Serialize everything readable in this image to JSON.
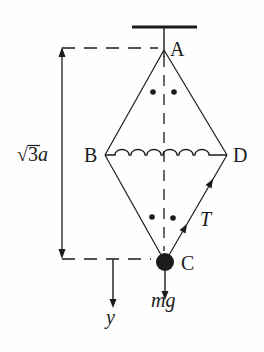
{
  "figure": {
    "background": "#fefefe",
    "ink_color": "#1b1b1b",
    "labels": {
      "point_a": "A",
      "point_b": "B",
      "point_c": "C",
      "point_d": "D",
      "tension": "T",
      "weight": "mg",
      "axis_y": "y",
      "dim_radical": "√3",
      "dim_variable": "a"
    }
  }
}
